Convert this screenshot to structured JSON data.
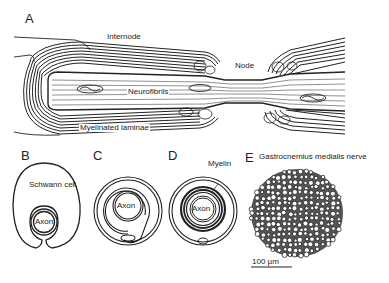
{
  "figure": {
    "panels": {
      "A": {
        "letter": "A",
        "labels": {
          "internode": "Internode",
          "node": "Node",
          "neurofibrils": "Neurofibrils",
          "myelinated_laminae": "Myelinated laminae"
        }
      },
      "B": {
        "letter": "B",
        "labels": {
          "schwann_cell": "Schwann cell",
          "axon": "Axon"
        }
      },
      "C": {
        "letter": "C",
        "labels": {
          "axon": "Axon"
        }
      },
      "D": {
        "letter": "D",
        "labels": {
          "myelin": "Myelin",
          "axon": "Axon"
        }
      },
      "E": {
        "letter": "E",
        "labels": {
          "title": "Gastrocnemius medialis nerve",
          "scale_bar": "100 µm"
        }
      }
    },
    "colors": {
      "ink": "#222222",
      "background": "#ffffff"
    }
  }
}
